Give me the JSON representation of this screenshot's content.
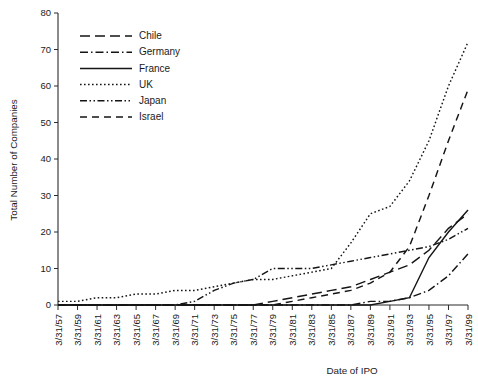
{
  "chart_data": {
    "type": "line",
    "title": "",
    "xlabel": "Date of IPO",
    "ylabel": "Total Number of Companies",
    "ylim": [
      0,
      80
    ],
    "ytick_step": 10,
    "yticks": [
      0,
      10,
      20,
      30,
      40,
      50,
      60,
      70,
      80
    ],
    "grid": false,
    "legend_position": "upper-left-inside",
    "x": [
      "3/31/57",
      "3/31/59",
      "3/31/61",
      "3/31/63",
      "3/31/65",
      "3/31/67",
      "3/31/69",
      "3/31/71",
      "3/31/73",
      "3/31/75",
      "3/31/77",
      "3/31/79",
      "3/31/81",
      "3/31/83",
      "3/31/85",
      "3/31/87",
      "3/31/89",
      "3/31/91",
      "3/31/93",
      "3/31/95",
      "3/31/97",
      "3/31/99"
    ],
    "series": [
      {
        "name": "Chile",
        "dash": "10,5",
        "values": [
          0,
          0,
          0,
          0,
          0,
          0,
          0,
          0,
          0,
          0,
          0,
          1,
          2,
          3,
          4,
          5,
          7,
          9,
          11,
          15,
          21,
          25
        ]
      },
      {
        "name": "Germany",
        "dash": "8,3,1.5,3",
        "values": [
          0,
          0,
          0,
          0,
          0,
          0,
          0,
          0,
          0,
          0,
          0,
          0,
          0,
          0,
          0,
          0,
          1,
          1,
          2,
          4,
          8,
          14
        ]
      },
      {
        "name": "France",
        "dash": "none",
        "values": [
          0,
          0,
          0,
          0,
          0,
          0,
          0,
          0,
          0,
          0,
          0,
          0,
          0,
          0,
          0,
          0,
          0,
          1,
          2,
          13,
          20,
          26
        ]
      },
      {
        "name": "UK",
        "dash": "1.6,2.4",
        "values": [
          1,
          1,
          2,
          2,
          3,
          3,
          4,
          4,
          5,
          6,
          7,
          7,
          8,
          9,
          10,
          17,
          25,
          27,
          34,
          45,
          60,
          72
        ]
      },
      {
        "name": "Japan",
        "dash": "7,2.5,1.5,2.5,1.5,2.5",
        "values": [
          0,
          0,
          0,
          0,
          0,
          0,
          0,
          1,
          4,
          6,
          7,
          10,
          10,
          10,
          11,
          12,
          13,
          14,
          15,
          16,
          18,
          21
        ]
      },
      {
        "name": "Israel",
        "dash": "7,5",
        "values": [
          0,
          0,
          0,
          0,
          0,
          0,
          0,
          0,
          0,
          0,
          0,
          0,
          1,
          2,
          3,
          4,
          6,
          9,
          16,
          30,
          45,
          59
        ]
      }
    ]
  }
}
